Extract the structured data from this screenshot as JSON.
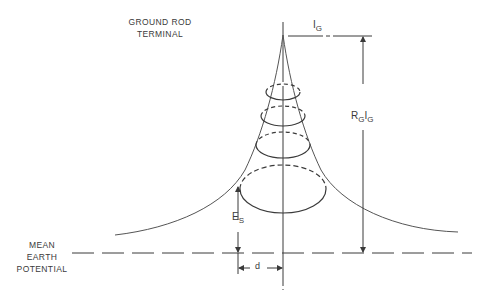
{
  "diagram": {
    "labels": {
      "ground_rod_terminal": [
        "GROUND ROD",
        "TERMINAL"
      ],
      "mean_earth_potential": [
        "MEAN",
        "EARTH",
        "POTENTIAL"
      ],
      "current": {
        "main": "I",
        "sub": "G"
      },
      "rod_potential": {
        "r": "R",
        "r_sub": "G",
        "i": "I",
        "i_sub": "G"
      },
      "surface_potential": {
        "main": "E",
        "sub": "S"
      },
      "distance": "d"
    },
    "colors": {
      "line": "#3a3a3a",
      "background": "#ffffff"
    }
  }
}
